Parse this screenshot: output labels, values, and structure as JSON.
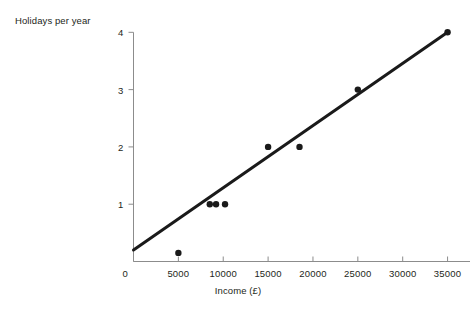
{
  "chart_data": {
    "type": "scatter",
    "title": "",
    "xlabel": "Income (£)",
    "ylabel": "Holidays per year",
    "xlim": [
      0,
      37500
    ],
    "ylim": [
      0,
      4.25
    ],
    "grid": false,
    "legend": null,
    "xticks": [
      0,
      5000,
      10000,
      15000,
      20000,
      25000,
      30000,
      35000
    ],
    "xtick_labels": [
      "0",
      "5000",
      "10000",
      "15000",
      "20000",
      "25000",
      "30000",
      "35000"
    ],
    "yticks": [
      1,
      2,
      3,
      4
    ],
    "ytick_labels": [
      "1",
      "2",
      "3",
      "4"
    ],
    "origin_label": "0",
    "points": [
      {
        "x": 5000,
        "y": 0.15
      },
      {
        "x": 8500,
        "y": 1.0
      },
      {
        "x": 9200,
        "y": 1.0
      },
      {
        "x": 10200,
        "y": 1.0
      },
      {
        "x": 15000,
        "y": 2.0
      },
      {
        "x": 18500,
        "y": 2.0
      },
      {
        "x": 25000,
        "y": 3.0
      },
      {
        "x": 35000,
        "y": 4.0
      }
    ],
    "trend_line": {
      "name": "line of best fit",
      "x_start": 0,
      "y_start": 0.2,
      "x_end": 35000,
      "y_end": 4.0
    },
    "style": {
      "point_color": "#1a1a1a",
      "point_radius_px": 3.2,
      "line_color": "#1a1a1a",
      "line_width_px": 3.0,
      "axis_color": "#8c8c8c",
      "text_color": "#231f20",
      "background": "#ffffff"
    }
  }
}
